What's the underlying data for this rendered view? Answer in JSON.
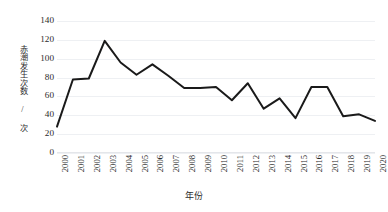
{
  "chart_data": {
    "type": "line",
    "title": "",
    "subtitle": "",
    "xlabel": "年份",
    "ylabel": "赤潮发生次数 / 次",
    "categories": [
      "2000",
      "2001",
      "2002",
      "2003",
      "2004",
      "2005",
      "2006",
      "2007",
      "2008",
      "2009",
      "2010",
      "2011",
      "2012",
      "2013",
      "2014",
      "2015",
      "2016",
      "2017",
      "2018",
      "2019",
      "2020"
    ],
    "values": [
      28,
      78,
      79,
      119,
      96,
      83,
      94,
      82,
      69,
      69,
      70,
      56,
      74,
      47,
      58,
      37,
      70,
      70,
      39,
      41,
      34
    ],
    "series": [
      {
        "name": "赤潮发生次数",
        "values": [
          28,
          78,
          79,
          119,
          96,
          83,
          94,
          82,
          69,
          69,
          70,
          56,
          74,
          47,
          58,
          37,
          70,
          70,
          39,
          41,
          34
        ],
        "color": "#1a1a1a"
      }
    ],
    "ylim": [
      0,
      140
    ],
    "xlim": [
      "2000",
      "2020"
    ],
    "y_ticks": [
      0,
      20,
      40,
      60,
      80,
      100,
      120,
      140
    ],
    "y_tick_labels": [
      "0",
      "20",
      "40",
      "60",
      "80",
      "100",
      "120",
      "140"
    ],
    "grid": true,
    "grid_axis": "y",
    "grid_color": "#eef0f3",
    "legend": false,
    "legend_position": "none",
    "line_width": 2,
    "markers": false,
    "background_color": "#ffffff",
    "axis_text_color": "#2b2b2b",
    "x_tick_rotation": 90
  },
  "caption": {
    "text": "·······"
  }
}
